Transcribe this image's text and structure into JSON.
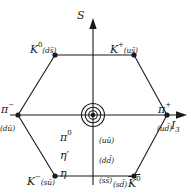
{
  "diagram": {
    "axes": {
      "vertical": {
        "label": "S",
        "name": "strangeness-axis"
      },
      "horizontal": {
        "label": "I",
        "sub": "3",
        "name": "isospin-axis"
      }
    },
    "line_color": "#1a1a1a",
    "background": "#ffffff",
    "vertices": [
      {
        "id": "k0",
        "symbol": "K",
        "superscript": "0",
        "quark": "(ds̄)",
        "overline": false,
        "x": 55,
        "y": 55
      },
      {
        "id": "kplus",
        "symbol": "K",
        "superscript": "+",
        "quark": "(us̄)",
        "overline": false,
        "x": 134,
        "y": 55
      },
      {
        "id": "piminus",
        "symbol": "π",
        "superscript": "−",
        "quark": "(dū)",
        "overline": false,
        "x": 18,
        "y": 115
      },
      {
        "id": "piplus",
        "symbol": "π",
        "superscript": "+",
        "quark": "(ud̄)",
        "overline": false,
        "x": 167,
        "y": 115
      },
      {
        "id": "kminus",
        "symbol": "K",
        "superscript": "−",
        "quark": "(sū)",
        "overline": false,
        "x": 55,
        "y": 176
      },
      {
        "id": "k0bar",
        "symbol": "K",
        "superscript": "0",
        "quark": "(sd̄)",
        "overline": true,
        "x": 134,
        "y": 176
      }
    ],
    "center": {
      "x": 93,
      "y": 115,
      "states": [
        "π",
        "η′",
        "η"
      ],
      "state_superscripts": [
        "0",
        "",
        ""
      ],
      "quark_contents": [
        "(uū)",
        "(dd̄)",
        "(ss̄)"
      ],
      "ring_count": 3
    },
    "labels": {
      "k0_symbol": "K",
      "k0_sup": "0",
      "k0_quark": "(ds̄)",
      "kplus_symbol": "K",
      "kplus_sup": "+",
      "kplus_quark": "(us̄)",
      "piminus_symbol": "π",
      "piminus_sup": "−",
      "piminus_quark": "(dū)",
      "piplus_symbol": "π",
      "piplus_sup": "+",
      "piplus_quark": "(ud̄)",
      "kminus_symbol": "K",
      "kminus_sup": "−",
      "kminus_quark": "(sū)",
      "k0bar_symbol": "K",
      "k0bar_sup": "0",
      "k0bar_quark": "(sd̄)",
      "pi0": "π",
      "pi0_sup": "0",
      "etaprime": "η′",
      "eta": "η",
      "uubar": "(uū)",
      "ddbar": "(dd̄)",
      "ssbar": "(ss̄)",
      "s_axis": "S",
      "i3_axis": "I",
      "i3_sub": "3"
    }
  }
}
